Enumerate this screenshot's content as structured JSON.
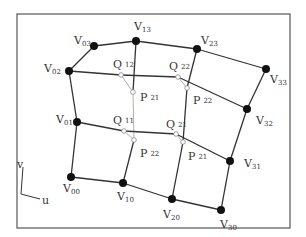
{
  "diagram": {
    "frame": {
      "x": 17,
      "y": 14,
      "w": 273,
      "h": 214,
      "stroke": "#555555"
    },
    "colors": {
      "edge": "#333333",
      "guide": "#9a9a9a",
      "vertex": "#111111",
      "aux_point": "#888888"
    },
    "vertices": [
      {
        "id": "V00",
        "name": "V",
        "sub": "00",
        "x": 71,
        "y": 177,
        "lx": 63,
        "ly": 192
      },
      {
        "id": "V01",
        "name": "V",
        "sub": "01",
        "x": 77,
        "y": 122,
        "lx": 56,
        "ly": 123
      },
      {
        "id": "V02",
        "name": "V",
        "sub": "02",
        "x": 69,
        "y": 71,
        "lx": 44,
        "ly": 72
      },
      {
        "id": "V03",
        "name": "V",
        "sub": "03",
        "x": 94,
        "y": 46,
        "lx": 74,
        "ly": 44
      },
      {
        "id": "V10",
        "name": "V",
        "sub": "10",
        "x": 123,
        "y": 183,
        "lx": 117,
        "ly": 200
      },
      {
        "id": "V13",
        "name": "V",
        "sub": "13",
        "x": 136,
        "y": 41,
        "lx": 134,
        "ly": 30
      },
      {
        "id": "V20",
        "name": "V",
        "sub": "20",
        "x": 172,
        "y": 199,
        "lx": 163,
        "ly": 218
      },
      {
        "id": "V23",
        "name": "V",
        "sub": "23",
        "x": 197,
        "y": 49,
        "lx": 201,
        "ly": 44
      },
      {
        "id": "V30",
        "name": "V",
        "sub": "30",
        "x": 221,
        "y": 210,
        "lx": 220,
        "ly": 228
      },
      {
        "id": "V31",
        "name": "V",
        "sub": "31",
        "x": 230,
        "y": 161,
        "lx": 244,
        "ly": 167
      },
      {
        "id": "V32",
        "name": "V",
        "sub": "32",
        "x": 247,
        "y": 109,
        "lx": 256,
        "ly": 124
      },
      {
        "id": "V33",
        "name": "V",
        "sub": "33",
        "x": 266,
        "y": 69,
        "lx": 270,
        "ly": 83
      }
    ],
    "aux_points": [
      {
        "id": "Q12",
        "name": "Q",
        "sub": "12",
        "x": 121,
        "y": 75,
        "lx": 113,
        "ly": 68
      },
      {
        "id": "Q22",
        "name": "Q",
        "sub": "22",
        "x": 178,
        "y": 77,
        "lx": 169,
        "ly": 70
      },
      {
        "id": "Q11",
        "name": "Q",
        "sub": "11",
        "x": 124,
        "y": 131,
        "lx": 113,
        "ly": 124
      },
      {
        "id": "Q21",
        "name": "Q",
        "sub": "21",
        "x": 176,
        "y": 134,
        "lx": 166,
        "ly": 128
      },
      {
        "id": "P21a",
        "name": "P",
        "sub": "21",
        "x": 133,
        "y": 92,
        "lx": 140,
        "ly": 101
      },
      {
        "id": "P22a",
        "name": "P",
        "sub": "22",
        "x": 187,
        "y": 88,
        "lx": 193,
        "ly": 104
      },
      {
        "id": "P22b",
        "name": "P",
        "sub": "22",
        "x": 134,
        "y": 140,
        "lx": 140,
        "ly": 157
      },
      {
        "id": "P21b",
        "name": "P",
        "sub": "21",
        "x": 183,
        "y": 142,
        "lx": 188,
        "ly": 160
      }
    ],
    "edges": [
      [
        94,
        46,
        69,
        71
      ],
      [
        94,
        46,
        136,
        41
      ],
      [
        136,
        41,
        197,
        49
      ],
      [
        197,
        49,
        266,
        69
      ],
      [
        69,
        71,
        77,
        122
      ],
      [
        77,
        122,
        71,
        177
      ],
      [
        71,
        177,
        123,
        183
      ],
      [
        123,
        183,
        172,
        199
      ],
      [
        172,
        199,
        221,
        210
      ],
      [
        266,
        69,
        247,
        109
      ],
      [
        247,
        109,
        230,
        161
      ],
      [
        230,
        161,
        221,
        210
      ],
      [
        69,
        71,
        121,
        75
      ],
      [
        121,
        75,
        178,
        77
      ],
      [
        178,
        77,
        247,
        109
      ],
      [
        77,
        122,
        124,
        131
      ],
      [
        124,
        131,
        176,
        134
      ],
      [
        176,
        134,
        230,
        161
      ],
      [
        136,
        41,
        133,
        92
      ],
      [
        134,
        140,
        123,
        183
      ],
      [
        197,
        49,
        187,
        88
      ],
      [
        187,
        88,
        183,
        142
      ],
      [
        183,
        142,
        172,
        199
      ]
    ],
    "guides": [
      [
        121,
        75,
        133,
        92
      ],
      [
        133,
        92,
        134,
        140
      ],
      [
        124,
        131,
        134,
        140
      ],
      [
        178,
        77,
        187,
        88
      ],
      [
        176,
        134,
        183,
        142
      ]
    ],
    "axes": {
      "origin": {
        "x": 21,
        "y": 194
      },
      "v_end": {
        "x": 23,
        "y": 167
      },
      "u_end": {
        "x": 40,
        "y": 199
      },
      "v_label": "v",
      "u_label": "u"
    }
  }
}
